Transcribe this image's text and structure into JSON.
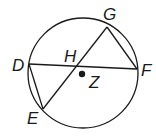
{
  "diagram": {
    "type": "circle-chords",
    "circle": {
      "center": "Z",
      "cx": 83,
      "cy": 73,
      "r": 55
    },
    "points": [
      {
        "name": "G",
        "x": 107,
        "y": 27,
        "label_x": 103,
        "label_y": 20
      },
      {
        "name": "F",
        "x": 137,
        "y": 69,
        "label_x": 141,
        "label_y": 76
      },
      {
        "name": "D",
        "x": 29,
        "y": 64,
        "label_x": 12,
        "label_y": 71
      },
      {
        "name": "E",
        "x": 43,
        "y": 109,
        "label_x": 27,
        "label_y": 124
      },
      {
        "name": "H",
        "x": 78,
        "y": 66,
        "label_x": 64,
        "label_y": 62
      },
      {
        "name": "Z",
        "x": 82,
        "y": 74,
        "label_x": 89,
        "label_y": 88
      }
    ],
    "segments": [
      "DF",
      "GE",
      "GF",
      "DE"
    ],
    "colors": {
      "stroke": "#1a1a1a",
      "background": "#ffffff"
    }
  }
}
